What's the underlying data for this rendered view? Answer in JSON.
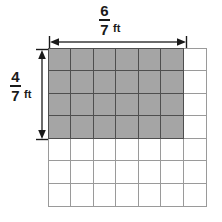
{
  "figure": {
    "type": "area-model-grid",
    "grid": {
      "columns": 7,
      "rows": 7,
      "total_cells": 49,
      "shaded_columns": 6,
      "shaded_rows": 4,
      "shaded_cells": 24,
      "cell_line_color": "#9a9a9a",
      "shaded_fill_color": "#a5a5a5",
      "shaded_line_color": "#4e4e4e",
      "background_color": "#ffffff"
    },
    "dimensions": {
      "width": {
        "numerator": "6",
        "denominator": "7",
        "unit": "ft",
        "spans_columns": 6,
        "arrow": "double-headed-horizontal"
      },
      "height": {
        "numerator": "4",
        "denominator": "7",
        "unit": "ft",
        "spans_rows": 4,
        "arrow": "double-headed-vertical"
      }
    }
  }
}
